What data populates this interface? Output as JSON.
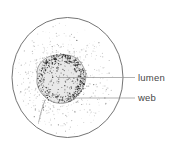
{
  "figure": {
    "labels": [
      {
        "id": "lumen",
        "text": "lumen"
      },
      {
        "id": "web",
        "text": "web"
      }
    ],
    "colors": {
      "background": "#ffffff",
      "outline": "#646464",
      "leader_line": "#909090",
      "label_text": "#474747",
      "stipple_dark": "#1e1e1e",
      "stipple_mid": "#6e6e6e",
      "stipple_light": "#ababab",
      "body_fill": "#e9e9e9"
    }
  }
}
